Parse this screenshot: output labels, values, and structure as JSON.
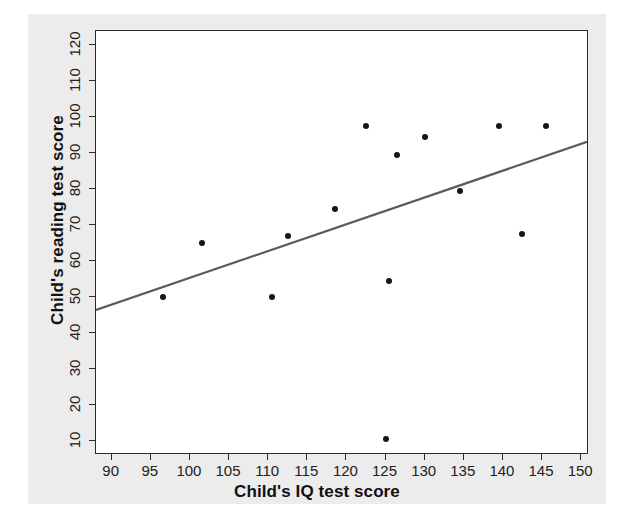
{
  "figure": {
    "background_color": "#ececec",
    "plot_background_color": "#ffffff",
    "frame_color": "#2a2a2a",
    "point_color": "#161616",
    "line_color": "#5a5a5a"
  },
  "chart_data": {
    "type": "scatter",
    "title": "",
    "xlabel": "Child's IQ test score",
    "ylabel": "Child's reading test score",
    "xlim": [
      88,
      151
    ],
    "ylim": [
      6,
      124
    ],
    "xticks": [
      90,
      95,
      100,
      105,
      110,
      115,
      120,
      125,
      130,
      135,
      140,
      145,
      150
    ],
    "yticks": [
      10,
      20,
      30,
      40,
      50,
      60,
      70,
      80,
      90,
      100,
      110,
      120
    ],
    "grid": false,
    "legend": false,
    "points": [
      {
        "x": 96.5,
        "y": 50
      },
      {
        "x": 101.5,
        "y": 65
      },
      {
        "x": 110.5,
        "y": 50
      },
      {
        "x": 112.5,
        "y": 67
      },
      {
        "x": 118.5,
        "y": 74.5
      },
      {
        "x": 122.5,
        "y": 97.5
      },
      {
        "x": 125.5,
        "y": 54.5
      },
      {
        "x": 125.0,
        "y": 10.5
      },
      {
        "x": 126.5,
        "y": 89.5
      },
      {
        "x": 130.0,
        "y": 94.5
      },
      {
        "x": 134.5,
        "y": 79.5
      },
      {
        "x": 139.5,
        "y": 97.5
      },
      {
        "x": 142.5,
        "y": 67.5
      },
      {
        "x": 145.5,
        "y": 97.5
      }
    ],
    "fit_line": {
      "name": "linear fit",
      "x_start": 88,
      "y_start": 46,
      "x_end": 151,
      "y_end": 93
    }
  }
}
